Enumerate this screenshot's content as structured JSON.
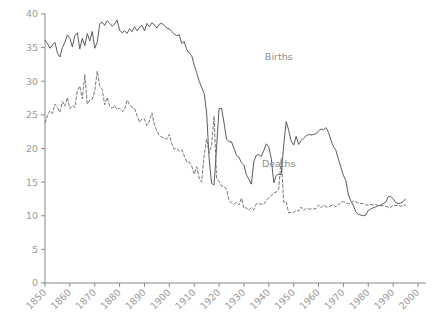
{
  "chart_data": {
    "type": "line",
    "title": "",
    "subtitle": "",
    "xlabel": "",
    "ylabel": "",
    "xlim": [
      1850,
      2000
    ],
    "ylim": [
      0,
      40
    ],
    "grid": false,
    "legend_position": "inline-annotations",
    "xticks": [
      1850,
      1860,
      1870,
      1880,
      1890,
      1900,
      1910,
      1920,
      1930,
      1940,
      1950,
      1960,
      1970,
      1980,
      1990,
      2000
    ],
    "xtick_labels": [
      "1850",
      "1860",
      "1870",
      "1880",
      "1890",
      "1900",
      "1910",
      "1920",
      "1930",
      "1940",
      "1950",
      "1960",
      "1970",
      "1980",
      "1990",
      "2000"
    ],
    "yticks": [
      0,
      5,
      10,
      15,
      20,
      25,
      30,
      35,
      40
    ],
    "ytick_labels": [
      "0",
      "5",
      "10",
      "15",
      "20",
      "25",
      "30",
      "35",
      "40"
    ],
    "annotations": [
      {
        "text": "Births",
        "x": 1944,
        "y": 33.2
      },
      {
        "text": "Deaths",
        "x": 1944,
        "y": 17.3
      }
    ],
    "series": [
      {
        "name": "Births",
        "style": "solid",
        "color": "#4a4a4a",
        "x": [
          1850,
          1851,
          1852,
          1853,
          1854,
          1855,
          1856,
          1857,
          1858,
          1859,
          1860,
          1861,
          1862,
          1863,
          1864,
          1865,
          1866,
          1867,
          1868,
          1869,
          1870,
          1871,
          1872,
          1873,
          1874,
          1875,
          1876,
          1877,
          1878,
          1879,
          1880,
          1881,
          1882,
          1883,
          1884,
          1885,
          1886,
          1887,
          1888,
          1889,
          1890,
          1891,
          1892,
          1893,
          1894,
          1895,
          1896,
          1897,
          1898,
          1899,
          1900,
          1901,
          1902,
          1903,
          1904,
          1905,
          1906,
          1907,
          1908,
          1909,
          1910,
          1911,
          1912,
          1913,
          1914,
          1915,
          1916,
          1917,
          1918,
          1919,
          1920,
          1921,
          1922,
          1923,
          1924,
          1925,
          1926,
          1927,
          1928,
          1929,
          1930,
          1931,
          1932,
          1933,
          1934,
          1935,
          1936,
          1937,
          1938,
          1939,
          1940,
          1941,
          1942,
          1943,
          1944,
          1945,
          1946,
          1947,
          1948,
          1949,
          1950,
          1951,
          1952,
          1953,
          1954,
          1955,
          1956,
          1957,
          1958,
          1959,
          1960,
          1961,
          1962,
          1963,
          1964,
          1965,
          1966,
          1967,
          1968,
          1969,
          1970,
          1971,
          1972,
          1973,
          1974,
          1975,
          1976,
          1977,
          1978,
          1979,
          1980,
          1981,
          1982,
          1983,
          1984,
          1985,
          1986,
          1987,
          1988,
          1989,
          1990,
          1991,
          1992,
          1993,
          1994,
          1995
        ],
        "values": [
          36.1,
          35.6,
          34.9,
          35.4,
          35.8,
          34.2,
          33.6,
          35.0,
          35.8,
          36.9,
          36.4,
          35.1,
          36.8,
          37.2,
          34.8,
          36.4,
          35.3,
          37.1,
          36.0,
          37.4,
          34.9,
          35.8,
          38.5,
          38.8,
          38.3,
          39.0,
          38.6,
          38.2,
          38.5,
          39.1,
          37.6,
          37.2,
          37.5,
          37.1,
          37.8,
          37.4,
          38.1,
          37.5,
          38.0,
          38.3,
          37.5,
          38.6,
          38.1,
          38.7,
          38.4,
          37.9,
          38.5,
          38.6,
          38.3,
          37.9,
          37.8,
          37.4,
          37.0,
          36.8,
          36.9,
          35.6,
          35.9,
          34.7,
          34.2,
          33.8,
          32.4,
          31.3,
          30.0,
          29.1,
          28.2,
          25.3,
          18.5,
          14.8,
          14.6,
          20.2,
          25.9,
          26.0,
          23.8,
          21.4,
          21.0,
          21.0,
          20.0,
          19.0,
          18.7,
          17.9,
          17.5,
          16.1,
          15.4,
          14.7,
          18.1,
          19.0,
          19.1,
          18.8,
          19.7,
          20.7,
          20.2,
          18.5,
          14.9,
          16.0,
          16.2,
          16.1,
          20.5,
          24.0,
          22.7,
          21.1,
          20.5,
          21.8,
          20.6,
          21.2,
          21.5,
          21.9,
          22.1,
          22.0,
          22.1,
          22.2,
          22.6,
          22.9,
          22.8,
          23.1,
          22.4,
          21.2,
          20.3,
          19.7,
          18.4,
          17.2,
          16.0,
          15.2,
          13.1,
          12.2,
          11.5,
          10.6,
          10.2,
          10.1,
          10.0,
          10.1,
          10.8,
          11.0,
          11.2,
          11.3,
          11.5,
          11.6,
          11.8,
          12.0,
          12.8,
          12.9,
          12.5,
          12.0,
          11.8,
          11.9,
          12.1,
          12.5
        ]
      },
      {
        "name": "Deaths",
        "style": "dashed",
        "color": "#6a6a6a",
        "x": [
          1850,
          1851,
          1852,
          1853,
          1854,
          1855,
          1856,
          1857,
          1858,
          1859,
          1860,
          1861,
          1862,
          1863,
          1864,
          1865,
          1866,
          1867,
          1868,
          1869,
          1870,
          1871,
          1872,
          1873,
          1874,
          1875,
          1876,
          1877,
          1878,
          1879,
          1880,
          1881,
          1882,
          1883,
          1884,
          1885,
          1886,
          1887,
          1888,
          1889,
          1890,
          1891,
          1892,
          1893,
          1894,
          1895,
          1896,
          1897,
          1898,
          1899,
          1900,
          1901,
          1902,
          1903,
          1904,
          1905,
          1906,
          1907,
          1908,
          1909,
          1910,
          1911,
          1912,
          1913,
          1914,
          1915,
          1916,
          1917,
          1918,
          1919,
          1920,
          1921,
          1922,
          1923,
          1924,
          1925,
          1926,
          1927,
          1928,
          1929,
          1930,
          1931,
          1932,
          1933,
          1934,
          1935,
          1936,
          1937,
          1938,
          1939,
          1940,
          1941,
          1942,
          1943,
          1944,
          1945,
          1946,
          1947,
          1948,
          1949,
          1950,
          1951,
          1952,
          1953,
          1954,
          1955,
          1956,
          1957,
          1958,
          1959,
          1960,
          1961,
          1962,
          1963,
          1964,
          1965,
          1966,
          1967,
          1968,
          1969,
          1970,
          1971,
          1972,
          1973,
          1974,
          1975,
          1976,
          1977,
          1978,
          1979,
          1980,
          1981,
          1982,
          1983,
          1984,
          1985,
          1986,
          1987,
          1988,
          1989,
          1990,
          1991,
          1992,
          1993,
          1994,
          1995
        ],
        "values": [
          23.8,
          24.9,
          25.6,
          25.2,
          26.6,
          26.1,
          25.4,
          27.0,
          26.3,
          27.6,
          25.9,
          26.4,
          26.1,
          28.6,
          29.3,
          27.4,
          31.0,
          26.6,
          27.2,
          27.3,
          28.5,
          31.5,
          29.3,
          28.8,
          26.5,
          27.6,
          26.3,
          26.0,
          26.4,
          25.8,
          26.0,
          25.5,
          25.7,
          27.2,
          26.6,
          26.1,
          26.0,
          24.9,
          23.9,
          24.4,
          24.4,
          23.4,
          24.1,
          25.3,
          23.5,
          22.6,
          21.9,
          21.7,
          21.5,
          21.4,
          22.1,
          20.7,
          19.9,
          20.0,
          19.6,
          19.8,
          18.9,
          18.0,
          18.0,
          17.4,
          16.2,
          17.3,
          15.6,
          15.0,
          19.0,
          21.4,
          19.3,
          20.6,
          24.8,
          15.6,
          15.1,
          14.4,
          14.4,
          13.9,
          12.3,
          11.9,
          11.7,
          12.0,
          11.6,
          12.6,
          11.1,
          11.2,
          10.8,
          11.2,
          10.9,
          11.8,
          11.8,
          11.7,
          11.7,
          12.3,
          12.7,
          13.0,
          13.4,
          13.5,
          14.0,
          18.5,
          12.0,
          12.1,
          10.4,
          10.5,
          10.5,
          10.8,
          10.7,
          11.3,
          10.8,
          11.1,
          11.0,
          11.0,
          11.0,
          11.1,
          11.6,
          11.2,
          11.6,
          11.3,
          11.3,
          11.5,
          11.6,
          11.3,
          11.6,
          12.0,
          12.1,
          11.9,
          11.8,
          11.8,
          12.2,
          12.1,
          11.9,
          11.8,
          11.8,
          11.6,
          11.6,
          11.7,
          11.6,
          11.7,
          11.5,
          11.5,
          11.5,
          11.4,
          11.3,
          11.2,
          11.6,
          11.5,
          11.6,
          11.4,
          11.5,
          11.6
        ]
      }
    ]
  },
  "axes": {
    "y_axis_name": "rate-per-1000",
    "x_axis_name": "year"
  }
}
